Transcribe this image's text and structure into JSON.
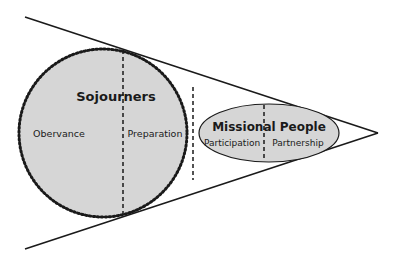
{
  "diagram": {
    "type": "funnel",
    "colors": {
      "line": "#1a1a1a",
      "fill": "#d6d6d6",
      "background": "#ffffff"
    },
    "circle": {
      "title": "Sojourners",
      "left_label": "Obervance",
      "right_label": "Preparation"
    },
    "ellipse": {
      "title": "Missional People",
      "left_label": "Participation",
      "right_label": "Partnership"
    }
  }
}
